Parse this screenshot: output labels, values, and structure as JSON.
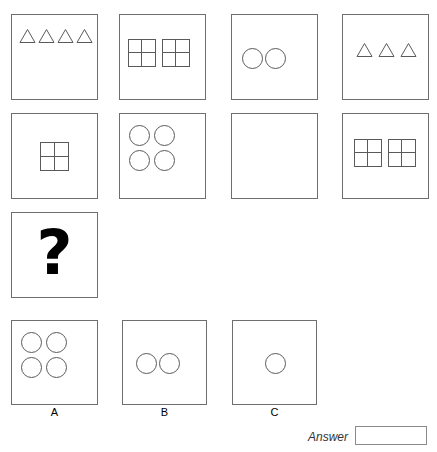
{
  "puzzle": {
    "type": "figural-matrix",
    "matrix": {
      "rows": 3,
      "cols": 4,
      "cells": [
        {
          "id": "r1c1",
          "row": 1,
          "col": 1,
          "shape": "triangle",
          "count": 4,
          "arrangement": "row",
          "position": "top",
          "description": "four outline triangles in a row near the top"
        },
        {
          "id": "r1c2",
          "row": 1,
          "col": 2,
          "shape": "grid2x2",
          "count": 2,
          "arrangement": "row",
          "position": "upper-left",
          "description": "two outline squares each divided into a 2x2 grid"
        },
        {
          "id": "r1c3",
          "row": 1,
          "col": 3,
          "shape": "circle",
          "count": 2,
          "arrangement": "row",
          "position": "left",
          "description": "two outline circles side by side"
        },
        {
          "id": "r1c4",
          "row": 1,
          "col": 4,
          "shape": "triangle",
          "count": 3,
          "arrangement": "row",
          "position": "center",
          "description": "three outline triangles in a row"
        },
        {
          "id": "r2c1",
          "row": 2,
          "col": 1,
          "shape": "grid2x2",
          "count": 1,
          "arrangement": "single",
          "position": "center",
          "description": "one outline square divided into a 2x2 grid"
        },
        {
          "id": "r2c2",
          "row": 2,
          "col": 2,
          "shape": "circle",
          "count": 4,
          "arrangement": "2x2",
          "position": "upper-left",
          "description": "four outline circles in a 2 by 2 arrangement"
        },
        {
          "id": "r2c3",
          "row": 2,
          "col": 3,
          "shape": "none",
          "count": 0,
          "arrangement": "none",
          "position": "none",
          "description": "empty box"
        },
        {
          "id": "r2c4",
          "row": 2,
          "col": 4,
          "shape": "grid2x2",
          "count": 2,
          "arrangement": "row",
          "position": "center",
          "description": "two outline squares each divided into a 2x2 grid"
        },
        {
          "id": "r3c1",
          "row": 3,
          "col": 1,
          "shape": "question-mark",
          "count": 1,
          "arrangement": "single",
          "position": "center",
          "glyph": "?",
          "description": "bold question mark marking the missing figure"
        }
      ]
    },
    "options": [
      {
        "id": "option-a",
        "label": "A",
        "shape": "circle",
        "count": 4,
        "arrangement": "2x2",
        "position": "upper-left",
        "description": "four outline circles in a 2 by 2 arrangement"
      },
      {
        "id": "option-b",
        "label": "B",
        "shape": "circle",
        "count": 2,
        "arrangement": "row",
        "position": "left-center",
        "description": "two outline circles side by side"
      },
      {
        "id": "option-c",
        "label": "C",
        "shape": "circle",
        "count": 1,
        "arrangement": "single",
        "position": "center",
        "description": "one outline circle"
      }
    ],
    "answer_field": {
      "label": "Answer",
      "value": "",
      "placeholder": ""
    }
  },
  "colors": {
    "cell_border": "#6e6e6e",
    "shape_stroke": "#5a5a5a",
    "question_mark": "#000000",
    "background": "#ffffff",
    "answer_box_border": "#8a8a8a",
    "label_text": "#000000",
    "answer_label_text": "#333333"
  }
}
